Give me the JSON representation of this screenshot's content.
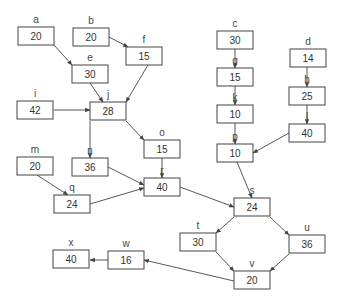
{
  "diagram": {
    "type": "activity-on-node network",
    "nodes": [
      {
        "id": "a",
        "label": "a",
        "value": "20"
      },
      {
        "id": "b",
        "label": "b",
        "value": "20"
      },
      {
        "id": "e",
        "label": "e",
        "value": "30"
      },
      {
        "id": "f",
        "label": "f",
        "value": "15"
      },
      {
        "id": "i",
        "label": "i",
        "value": "42"
      },
      {
        "id": "j",
        "label": "j",
        "value": "28"
      },
      {
        "id": "m",
        "label": "m",
        "value": "20"
      },
      {
        "id": "n",
        "label": "n",
        "value": "36"
      },
      {
        "id": "o",
        "label": "o",
        "value": "15"
      },
      {
        "id": "q",
        "label": "q",
        "value": "24"
      },
      {
        "id": "r",
        "label": "r",
        "value": "40"
      },
      {
        "id": "c",
        "label": "c",
        "value": "30"
      },
      {
        "id": "g",
        "label": "g",
        "value": "15"
      },
      {
        "id": "k",
        "label": "k",
        "value": "10"
      },
      {
        "id": "p",
        "label": "p",
        "value": "10"
      },
      {
        "id": "d",
        "label": "d",
        "value": "14"
      },
      {
        "id": "h",
        "label": "h",
        "value": "25"
      },
      {
        "id": "l",
        "label": "l",
        "value": "40"
      },
      {
        "id": "s",
        "label": "s",
        "value": "24"
      },
      {
        "id": "t",
        "label": "t",
        "value": "30"
      },
      {
        "id": "u",
        "label": "u",
        "value": "36"
      },
      {
        "id": "v",
        "label": "v",
        "value": "20"
      },
      {
        "id": "w",
        "label": "w",
        "value": "16"
      },
      {
        "id": "x",
        "label": "x",
        "value": "40"
      }
    ],
    "edges": [
      {
        "from": "a",
        "to": "e"
      },
      {
        "from": "b",
        "to": "f"
      },
      {
        "from": "e",
        "to": "j"
      },
      {
        "from": "f",
        "to": "j"
      },
      {
        "from": "i",
        "to": "j"
      },
      {
        "from": "j",
        "to": "n"
      },
      {
        "from": "j",
        "to": "o"
      },
      {
        "from": "m",
        "to": "q"
      },
      {
        "from": "n",
        "to": "r"
      },
      {
        "from": "o",
        "to": "r"
      },
      {
        "from": "q",
        "to": "r"
      },
      {
        "from": "c",
        "to": "g"
      },
      {
        "from": "g",
        "to": "k"
      },
      {
        "from": "k",
        "to": "p"
      },
      {
        "from": "d",
        "to": "h"
      },
      {
        "from": "h",
        "to": "l"
      },
      {
        "from": "l",
        "to": "p"
      },
      {
        "from": "p",
        "to": "s"
      },
      {
        "from": "r",
        "to": "s"
      },
      {
        "from": "s",
        "to": "t"
      },
      {
        "from": "s",
        "to": "u"
      },
      {
        "from": "t",
        "to": "v"
      },
      {
        "from": "u",
        "to": "v"
      },
      {
        "from": "v",
        "to": "w"
      },
      {
        "from": "w",
        "to": "x"
      }
    ]
  }
}
